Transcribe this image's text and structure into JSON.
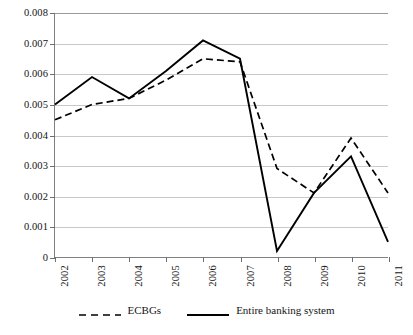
{
  "chart_data": {
    "type": "line",
    "title": "",
    "subtitle": "",
    "xlabel": "",
    "ylabel": "",
    "categories": [
      "2002",
      "2003",
      "2004",
      "2005",
      "2006",
      "2007",
      "2008",
      "2009",
      "2010",
      "2011"
    ],
    "ylim": [
      0,
      0.008
    ],
    "xlim": [
      2002,
      2011
    ],
    "yticks": [
      0,
      0.001,
      0.002,
      0.003,
      0.004,
      0.005,
      0.006,
      0.007,
      0.008
    ],
    "ytick_labels": [
      "0",
      "0.001",
      "0.002",
      "0.003",
      "0.004",
      "0.005",
      "0.006",
      "0.007",
      "0.008"
    ],
    "grid": true,
    "grid_axis": "y",
    "legend_position": "bottom",
    "series": [
      {
        "name": "ECBGs",
        "style": "dashed",
        "color": "#000000",
        "values": [
          0.0045,
          0.005,
          0.0052,
          0.0058,
          0.0065,
          0.0064,
          0.0029,
          0.0021,
          0.0039,
          0.0021
        ]
      },
      {
        "name": "Entire banking system",
        "style": "solid",
        "color": "#000000",
        "values": [
          0.005,
          0.0059,
          0.0052,
          0.0061,
          0.0071,
          0.0065,
          0.0002,
          0.0021,
          0.0033,
          0.0005
        ]
      }
    ]
  },
  "legend": {
    "items": [
      {
        "label": "ECBGs",
        "style": "dashed"
      },
      {
        "label": "Entire banking system",
        "style": "solid"
      }
    ]
  },
  "axes": {
    "y_min_label": "0",
    "y_max_label": "0.008"
  }
}
